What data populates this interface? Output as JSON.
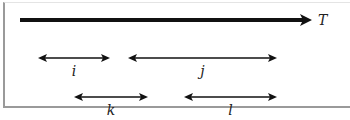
{
  "diagram": {
    "axis": {
      "label": "T",
      "x1": 20,
      "x2": 312,
      "y": 20
    },
    "intervals": [
      {
        "label": "i",
        "x1": 38,
        "x2": 110,
        "y": 58
      },
      {
        "label": "j",
        "x1": 128,
        "x2": 277,
        "y": 58
      },
      {
        "label": "k",
        "x1": 74,
        "x2": 148,
        "y": 97
      },
      {
        "label": "l",
        "x1": 184,
        "x2": 277,
        "y": 97
      }
    ],
    "colors": {
      "line": "#111111",
      "frame": "#9a9a9a"
    }
  }
}
